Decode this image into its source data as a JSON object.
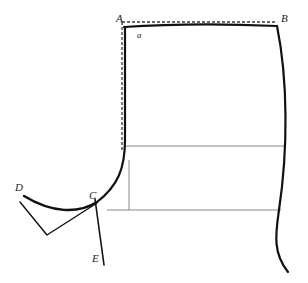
{
  "figure": {
    "width": 308,
    "height": 283,
    "background_color": "#ffffff"
  },
  "colors": {
    "outline": "#111111",
    "grid": "#8a8a8a",
    "dashed": "#3a3a3a",
    "label": "#1a1a1a"
  },
  "labels": [
    {
      "id": "A",
      "text": "A",
      "x": 116,
      "y": 13,
      "size": "normal"
    },
    {
      "id": "B",
      "text": "B",
      "x": 281,
      "y": 13,
      "size": "normal"
    },
    {
      "id": "a",
      "text": "a",
      "x": 137,
      "y": 31,
      "size": "small"
    },
    {
      "id": "C",
      "text": "C",
      "x": 89,
      "y": 190,
      "size": "normal"
    },
    {
      "id": "D",
      "text": "D",
      "x": 15,
      "y": 182,
      "size": "normal"
    },
    {
      "id": "E",
      "text": "E",
      "x": 92,
      "y": 253,
      "size": "normal"
    }
  ],
  "points": {
    "A": {
      "x": 124,
      "y": 23
    },
    "B": {
      "x": 277,
      "y": 25
    },
    "C": {
      "x": 97,
      "y": 202
    },
    "D": {
      "x": 24,
      "y": 194
    },
    "E": {
      "x": 104,
      "y": 265
    }
  },
  "geometry": {
    "top_edge": {
      "name": "top-edge-A-to-B",
      "path": "M 124 27 C 170 24, 230 24, 277 26",
      "stroke_width": 2.2
    },
    "right_edge": {
      "name": "right-edge-B-down",
      "path": "M 277 26 C 288 80, 288 150, 279 210 C 276 232, 272 252, 288 272",
      "stroke_width": 2.2
    },
    "left_edge": {
      "name": "left-edge-A-down-to-C",
      "path": "M 125 27 L 125 140 C 125 168, 118 186, 97 202",
      "stroke_width": 2.2
    },
    "curve_C_to_D": {
      "name": "curve-C-to-D",
      "path": "M 97 202 C 78 214, 52 213, 24 196",
      "stroke_width": 2.4
    },
    "wedge_D": {
      "name": "wedge-under-D",
      "path": "M 20 202 L 47 235 L 97 203",
      "stroke_width": 1.4
    },
    "line_C_to_E": {
      "name": "line-C-to-E",
      "path": "M 95 199 L 104 265",
      "stroke_width": 1.6
    },
    "dashed_top": {
      "name": "dashed-top-A-to-B",
      "path": "M 122 22 L 277 22",
      "stroke_width": 1.3,
      "dash": "3 2"
    },
    "dashed_left": {
      "name": "dashed-left-A-down",
      "path": "M 122 22 L 122 150",
      "stroke_width": 1.3,
      "dash": "3 2"
    },
    "grid_lines": [
      {
        "name": "grid-horizontal-upper",
        "path": "M 125 146 L 285 146"
      },
      {
        "name": "grid-horizontal-lower",
        "path": "M 107 210 L 281 210"
      },
      {
        "name": "grid-vertical-center",
        "path": "M 191 27 L 191 262"
      },
      {
        "name": "grid-vertical-short-left",
        "path": "M 129 160 L 129 210"
      }
    ],
    "grid_stroke_width": 1.0
  }
}
